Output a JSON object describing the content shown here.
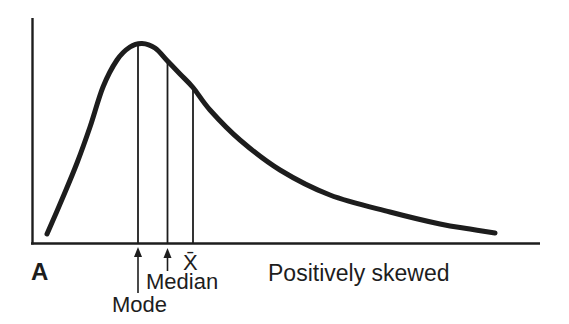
{
  "figure": {
    "panel_label": "A",
    "caption": "Positively skewed",
    "labels": {
      "mode": "Mode",
      "median": "Median",
      "mean": "X̄"
    }
  },
  "diagram": {
    "canvas": {
      "width": 569,
      "height": 324
    },
    "ink_color": "#1d1d1d",
    "background_color": "#ffffff",
    "y_axis": {
      "x": 32.5,
      "y_top": 18,
      "y_bottom": 244.5,
      "stroke_width": 2.4
    },
    "x_axis": {
      "y": 243.5,
      "x_left": 31,
      "x_right": 540,
      "stroke_width": 2.6
    },
    "curve": {
      "stroke_width": 5,
      "points": [
        [
          47,
          234
        ],
        [
          63,
          197
        ],
        [
          77,
          163
        ],
        [
          90,
          127
        ],
        [
          103,
          87
        ],
        [
          117,
          60
        ],
        [
          130,
          47
        ],
        [
          142,
          43.5
        ],
        [
          155,
          48
        ],
        [
          167.5,
          61
        ],
        [
          180,
          74
        ],
        [
          193,
          87.5
        ],
        [
          210,
          110
        ],
        [
          240,
          140
        ],
        [
          280,
          170
        ],
        [
          330,
          195
        ],
        [
          390,
          212
        ],
        [
          440,
          224
        ],
        [
          470,
          229
        ],
        [
          495,
          233
        ]
      ]
    },
    "markers": [
      {
        "name": "mode-line",
        "x": 138,
        "y_top": 46,
        "y_bottom": 243.5
      },
      {
        "name": "median-line",
        "x": 167.5,
        "y_top": 61,
        "y_bottom": 243.5
      },
      {
        "name": "mean-line",
        "x": 193,
        "y_top": 87.5,
        "y_bottom": 243.5
      }
    ],
    "arrows": [
      {
        "name": "mode-arrow",
        "x": 138,
        "tip_y": 247,
        "tail_y": 293
      },
      {
        "name": "median-arrow",
        "x": 167.5,
        "tip_y": 248,
        "tail_y": 271
      }
    ]
  }
}
